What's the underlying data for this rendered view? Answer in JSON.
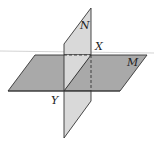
{
  "diagram": {
    "planes": [
      {
        "name": "M",
        "fill": "#a9a9a9",
        "label": "M"
      },
      {
        "name": "N",
        "fill": "#d9d9d9",
        "label": "N"
      }
    ],
    "points": [
      {
        "name": "X",
        "label": "X"
      },
      {
        "name": "Y",
        "label": "Y"
      }
    ],
    "colors": {
      "stroke": "#333333",
      "horizon_line": "#c8c8c8",
      "plane_m": "#a9a9a9",
      "plane_n": "#d9d9d9"
    }
  }
}
